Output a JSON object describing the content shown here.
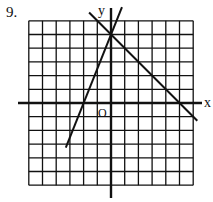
{
  "problem_number": "9.",
  "chart_data": {
    "type": "line",
    "title": "",
    "xlabel": "x",
    "ylabel": "y",
    "origin_label": "O",
    "xlim": [
      -6,
      6
    ],
    "ylim": [
      -6,
      6
    ],
    "grid": true,
    "series": [
      {
        "name": "line-1",
        "equation": "y = 2.5x + 5",
        "points": [
          [
            -2,
            0
          ],
          [
            0,
            5
          ]
        ]
      },
      {
        "name": "line-2",
        "equation": "y = -x + 5",
        "points": [
          [
            0,
            5
          ],
          [
            5,
            0
          ]
        ]
      }
    ]
  }
}
